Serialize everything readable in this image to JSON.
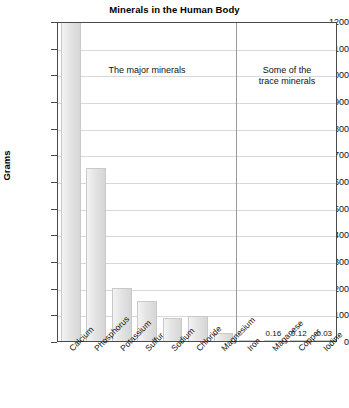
{
  "chart_data": {
    "type": "bar",
    "title": "Minerals in the Human Body",
    "xlabel": "",
    "ylabel": "Grams",
    "ylim": [
      0,
      1200
    ],
    "ytick_step": 100,
    "yticks": [
      0,
      100,
      200,
      300,
      400,
      500,
      600,
      700,
      800,
      900,
      1000,
      1100,
      1200
    ],
    "grid": true,
    "legend": "none",
    "categories": [
      "Calcium",
      "Phosphorus",
      "Potassium",
      "Sulfur",
      "Sodium",
      "Chloride",
      "Magnesium",
      "Iron",
      "Maganese",
      "Copper",
      "Iodine"
    ],
    "values": [
      1200,
      650,
      200,
      150,
      85,
      95,
      30,
      4,
      0.16,
      0.12,
      0.03
    ],
    "point_labels": [
      "",
      "",
      "",
      "",
      "",
      "",
      "",
      "",
      "0.16",
      "0.12",
      "0.03"
    ],
    "annotations": [
      {
        "text": "The major minerals",
        "group_categories": [
          "Calcium",
          "Phosphorus",
          "Potassium",
          "Sulfur",
          "Sodium",
          "Chloride",
          "Magnesium"
        ]
      },
      {
        "text": "Some of the\ntrace minerals",
        "group_categories": [
          "Iron",
          "Maganese",
          "Copper",
          "Iodine"
        ]
      }
    ],
    "divider_after_category": "Magnesium",
    "bar_color": "#e4e4e4",
    "bar_edge_color": "#c9c9c9",
    "grid_color": "#d8d8d8",
    "axis_color": "#4a4a4a"
  }
}
